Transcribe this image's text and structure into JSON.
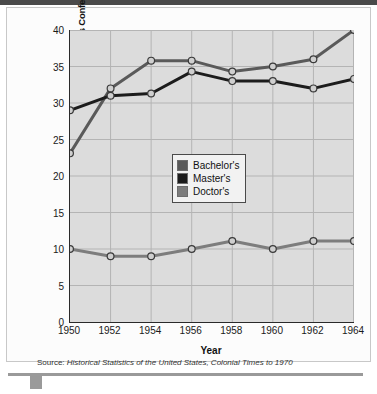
{
  "figure": {
    "source_label": "Source:",
    "source_title": "Historical Statistics of the United States, Colonial Times to 1970"
  },
  "chart_data": {
    "type": "line",
    "title": "",
    "xlabel": "Year",
    "ylabel": "Percent of All Degrees Conferred",
    "x": [
      1950,
      1952,
      1954,
      1956,
      1958,
      1960,
      1962,
      1964
    ],
    "categories": [
      "1950",
      "1952",
      "1954",
      "1956",
      "1958",
      "1960",
      "1962",
      "1964"
    ],
    "xlim": [
      1950,
      1964
    ],
    "ylim": [
      0,
      40
    ],
    "yticks": [
      0,
      5,
      10,
      15,
      20,
      25,
      30,
      35,
      40
    ],
    "ytick_labels": [
      "0",
      "5",
      "10",
      "15",
      "20",
      "25",
      "30",
      "35",
      "40"
    ],
    "grid": true,
    "legend_position": "center",
    "series": [
      {
        "name": "Bachelor's",
        "color": "#5a5a5a",
        "values": [
          23.1,
          32.0,
          35.8,
          35.8,
          34.3,
          35.0,
          36.0,
          40.0
        ]
      },
      {
        "name": "Master's",
        "color": "#1c1c1c",
        "values": [
          29.0,
          31.0,
          31.3,
          34.3,
          33.0,
          33.0,
          32.0,
          33.3
        ]
      },
      {
        "name": "Doctor's",
        "color": "#7d7d7d",
        "values": [
          10.0,
          9.0,
          9.0,
          10.0,
          11.1,
          10.0,
          11.1,
          11.1
        ]
      }
    ],
    "marker": "circle",
    "plot_background": "#dcdcdc",
    "gridline_color": "#b4b4b4",
    "axis_color": "#2a2a2a"
  }
}
